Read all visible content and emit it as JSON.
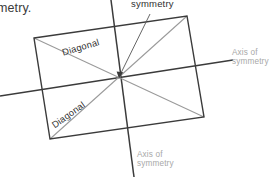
{
  "figure": {
    "title_fragment": "metry.",
    "callout": {
      "label": "symmetry",
      "leader_from": {
        "x": 150,
        "y": 14
      },
      "leader_to": {
        "x": 119,
        "y": 76
      }
    },
    "rectangle": {
      "name": "rectangle",
      "stroke": "#3b3b3b",
      "stroke_width": 1.4,
      "corners": {
        "top_left": {
          "x": 34,
          "y": 38
        },
        "top_right": {
          "x": 187,
          "y": 16
        },
        "bottom_right": {
          "x": 204,
          "y": 117
        },
        "bottom_left": {
          "x": 50,
          "y": 139
        }
      }
    },
    "diagonals": [
      {
        "label": "Diagonal",
        "name": "diagonal-top-left-to-bottom-right",
        "from": {
          "x": 34,
          "y": 38
        },
        "to": {
          "x": 204,
          "y": 117
        },
        "stroke": "#9a9a9a",
        "rotation_deg": -16.5
      },
      {
        "label": "Diagonal",
        "name": "diagonal-bottom-left-to-top-right",
        "from": {
          "x": 50,
          "y": 139
        },
        "to": {
          "x": 187,
          "y": 16
        },
        "stroke": "#9a9a9a",
        "rotation_deg": -35.5
      }
    ],
    "axes_of_symmetry": [
      {
        "label_line1": "Axis of",
        "label_line2": "symmetry",
        "name": "axis-of-symmetry-horizontal",
        "from": {
          "x": 0,
          "y": 96
        },
        "to": {
          "x": 233,
          "y": 60
        },
        "stroke": "#3b3b3b",
        "stroke_width": 1.5
      },
      {
        "label_line1": "Axis of",
        "label_line2": "symmetry",
        "name": "axis-of-symmetry-vertical",
        "from": {
          "x": 111,
          "y": 0
        },
        "to": {
          "x": 134,
          "y": 177
        },
        "stroke": "#3b3b3b",
        "stroke_width": 1.5
      }
    ],
    "center": {
      "x": 119,
      "y": 77
    },
    "colors": {
      "ink": "#3b3b3b",
      "diagonal": "#9a9a9a",
      "muted_label": "#a8a8a8",
      "background": "#ffffff"
    }
  }
}
